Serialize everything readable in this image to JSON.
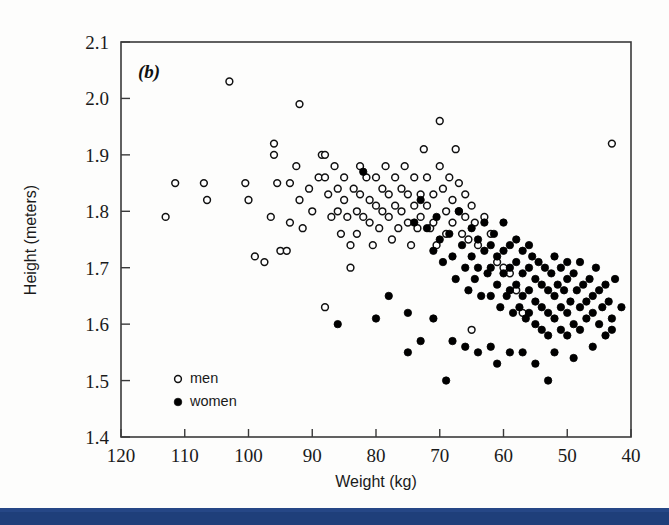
{
  "figure": {
    "panel_label": "(b)",
    "background_color": "#fdfdfc",
    "frame_color": "#3a3a3a",
    "bottom_bar_color": "#1f3f7a"
  },
  "axes": {
    "x_title": "Weight (kg)",
    "y_title": "Height (meters)",
    "x_ticks": [
      "120",
      "110",
      "100",
      "90",
      "80",
      "70",
      "60",
      "50",
      "40"
    ],
    "y_ticks": [
      "2.1",
      "2.0",
      "1.9",
      "1.8",
      "1.7",
      "1.6",
      "1.5",
      "1.4"
    ]
  },
  "legend": {
    "items": [
      {
        "label": "men",
        "marker": "open-circle"
      },
      {
        "label": "women",
        "marker": "filled-circle"
      }
    ]
  },
  "chart_data": {
    "type": "scatter",
    "title": "(b)",
    "xlabel": "Weight (kg)",
    "ylabel": "Height (meters)",
    "xlim": [
      120,
      40
    ],
    "ylim": [
      1.4,
      2.1
    ],
    "x_inverted": true,
    "grid": false,
    "legend_position": "bottom-left-inside",
    "xticks": [
      120,
      110,
      100,
      90,
      80,
      70,
      60,
      50,
      40
    ],
    "yticks": [
      2.1,
      2.0,
      1.9,
      1.8,
      1.7,
      1.6,
      1.5,
      1.4
    ],
    "marker_size_px": 8,
    "series": [
      {
        "name": "men",
        "marker": "open-circle",
        "color": "#111111",
        "fill": "none",
        "points": [
          [
            111.5,
            1.85
          ],
          [
            113.0,
            1.79
          ],
          [
            107.0,
            1.85
          ],
          [
            106.5,
            1.82
          ],
          [
            103.0,
            2.03
          ],
          [
            100.5,
            1.85
          ],
          [
            100.0,
            1.82
          ],
          [
            96.0,
            1.92
          ],
          [
            96.0,
            1.9
          ],
          [
            95.5,
            1.85
          ],
          [
            96.5,
            1.79
          ],
          [
            95.0,
            1.73
          ],
          [
            94.0,
            1.73
          ],
          [
            93.5,
            1.85
          ],
          [
            93.5,
            1.78
          ],
          [
            92.0,
            1.99
          ],
          [
            92.5,
            1.88
          ],
          [
            92.0,
            1.82
          ],
          [
            91.5,
            1.77
          ],
          [
            90.5,
            1.84
          ],
          [
            90.0,
            1.8
          ],
          [
            89.0,
            1.86
          ],
          [
            88.5,
            1.9
          ],
          [
            88.0,
            1.9
          ],
          [
            88.0,
            1.86
          ],
          [
            87.5,
            1.83
          ],
          [
            87.0,
            1.79
          ],
          [
            86.5,
            1.88
          ],
          [
            86.0,
            1.84
          ],
          [
            86.0,
            1.8
          ],
          [
            85.5,
            1.76
          ],
          [
            85.0,
            1.86
          ],
          [
            85.0,
            1.82
          ],
          [
            84.5,
            1.79
          ],
          [
            84.0,
            1.74
          ],
          [
            84.0,
            1.7
          ],
          [
            83.5,
            1.84
          ],
          [
            83.0,
            1.8
          ],
          [
            83.0,
            1.76
          ],
          [
            82.5,
            1.88
          ],
          [
            82.5,
            1.83
          ],
          [
            82.0,
            1.79
          ],
          [
            81.5,
            1.86
          ],
          [
            81.0,
            1.82
          ],
          [
            81.0,
            1.78
          ],
          [
            80.5,
            1.74
          ],
          [
            80.0,
            1.86
          ],
          [
            80.0,
            1.81
          ],
          [
            79.5,
            1.77
          ],
          [
            79.0,
            1.84
          ],
          [
            79.0,
            1.8
          ],
          [
            78.5,
            1.88
          ],
          [
            78.0,
            1.83
          ],
          [
            78.0,
            1.79
          ],
          [
            77.5,
            1.75
          ],
          [
            77.0,
            1.86
          ],
          [
            77.0,
            1.81
          ],
          [
            76.5,
            1.77
          ],
          [
            76.0,
            1.84
          ],
          [
            76.0,
            1.8
          ],
          [
            75.5,
            1.88
          ],
          [
            75.0,
            1.83
          ],
          [
            75.0,
            1.78
          ],
          [
            74.5,
            1.74
          ],
          [
            74.0,
            1.86
          ],
          [
            74.0,
            1.81
          ],
          [
            73.5,
            1.77
          ],
          [
            73.0,
            1.83
          ],
          [
            73.0,
            1.79
          ],
          [
            72.5,
            1.91
          ],
          [
            72.0,
            1.86
          ],
          [
            72.0,
            1.81
          ],
          [
            71.5,
            1.77
          ],
          [
            71.0,
            1.83
          ],
          [
            71.0,
            1.78
          ],
          [
            70.5,
            1.74
          ],
          [
            70.0,
            1.96
          ],
          [
            70.0,
            1.88
          ],
          [
            69.5,
            1.84
          ],
          [
            69.0,
            1.8
          ],
          [
            69.0,
            1.76
          ],
          [
            68.5,
            1.86
          ],
          [
            68.0,
            1.82
          ],
          [
            68.0,
            1.78
          ],
          [
            67.5,
            1.91
          ],
          [
            67.0,
            1.85
          ],
          [
            67.0,
            1.8
          ],
          [
            66.5,
            1.76
          ],
          [
            66.0,
            1.83
          ],
          [
            66.0,
            1.79
          ],
          [
            65.5,
            1.75
          ],
          [
            65.0,
            1.81
          ],
          [
            65.0,
            1.59
          ],
          [
            64.5,
            1.78
          ],
          [
            64.0,
            1.74
          ],
          [
            63.0,
            1.79
          ],
          [
            62.0,
            1.76
          ],
          [
            61.0,
            1.71
          ],
          [
            60.0,
            1.7
          ],
          [
            59.0,
            1.69
          ],
          [
            58.0,
            1.66
          ],
          [
            57.0,
            1.62
          ],
          [
            43.0,
            1.92
          ],
          [
            88.0,
            1.63
          ],
          [
            99.0,
            1.72
          ],
          [
            97.5,
            1.71
          ]
        ]
      },
      {
        "name": "women",
        "marker": "filled-circle",
        "color": "#000000",
        "fill": "#000000",
        "points": [
          [
            82.0,
            1.87
          ],
          [
            74.0,
            1.78
          ],
          [
            73.0,
            1.82
          ],
          [
            72.0,
            1.77
          ],
          [
            71.0,
            1.73
          ],
          [
            70.5,
            1.79
          ],
          [
            70.0,
            1.75
          ],
          [
            69.5,
            1.71
          ],
          [
            69.0,
            1.5
          ],
          [
            68.5,
            1.76
          ],
          [
            68.0,
            1.72
          ],
          [
            67.5,
            1.68
          ],
          [
            67.0,
            1.8
          ],
          [
            66.5,
            1.74
          ],
          [
            66.0,
            1.7
          ],
          [
            65.5,
            1.66
          ],
          [
            65.0,
            1.77
          ],
          [
            65.0,
            1.72
          ],
          [
            64.5,
            1.68
          ],
          [
            64.0,
            1.75
          ],
          [
            64.0,
            1.7
          ],
          [
            63.5,
            1.65
          ],
          [
            63.0,
            1.78
          ],
          [
            63.0,
            1.73
          ],
          [
            62.5,
            1.69
          ],
          [
            62.0,
            1.74
          ],
          [
            62.0,
            1.7
          ],
          [
            62.0,
            1.65
          ],
          [
            61.5,
            1.76
          ],
          [
            61.0,
            1.72
          ],
          [
            61.0,
            1.67
          ],
          [
            60.5,
            1.63
          ],
          [
            60.0,
            1.78
          ],
          [
            60.0,
            1.73
          ],
          [
            60.0,
            1.69
          ],
          [
            59.5,
            1.65
          ],
          [
            59.0,
            1.74
          ],
          [
            59.0,
            1.7
          ],
          [
            59.0,
            1.66
          ],
          [
            58.5,
            1.62
          ],
          [
            58.0,
            1.75
          ],
          [
            58.0,
            1.71
          ],
          [
            58.0,
            1.67
          ],
          [
            57.5,
            1.63
          ],
          [
            57.0,
            1.73
          ],
          [
            57.0,
            1.69
          ],
          [
            57.0,
            1.65
          ],
          [
            56.5,
            1.61
          ],
          [
            56.0,
            1.74
          ],
          [
            56.0,
            1.7
          ],
          [
            56.0,
            1.66
          ],
          [
            56.0,
            1.62
          ],
          [
            55.5,
            1.72
          ],
          [
            55.0,
            1.68
          ],
          [
            55.0,
            1.64
          ],
          [
            55.0,
            1.6
          ],
          [
            54.5,
            1.71
          ],
          [
            54.0,
            1.67
          ],
          [
            54.0,
            1.63
          ],
          [
            54.0,
            1.59
          ],
          [
            53.5,
            1.7
          ],
          [
            53.0,
            1.66
          ],
          [
            53.0,
            1.62
          ],
          [
            53.0,
            1.58
          ],
          [
            52.5,
            1.69
          ],
          [
            52.0,
            1.72
          ],
          [
            52.0,
            1.65
          ],
          [
            52.0,
            1.61
          ],
          [
            51.5,
            1.67
          ],
          [
            51.0,
            1.7
          ],
          [
            51.0,
            1.63
          ],
          [
            51.0,
            1.59
          ],
          [
            50.5,
            1.66
          ],
          [
            50.0,
            1.71
          ],
          [
            50.0,
            1.68
          ],
          [
            50.0,
            1.62
          ],
          [
            50.0,
            1.58
          ],
          [
            49.5,
            1.64
          ],
          [
            49.0,
            1.69
          ],
          [
            49.0,
            1.6
          ],
          [
            48.5,
            1.66
          ],
          [
            48.0,
            1.71
          ],
          [
            48.0,
            1.63
          ],
          [
            48.0,
            1.59
          ],
          [
            47.5,
            1.67
          ],
          [
            47.0,
            1.64
          ],
          [
            47.0,
            1.61
          ],
          [
            46.5,
            1.68
          ],
          [
            46.0,
            1.65
          ],
          [
            46.0,
            1.62
          ],
          [
            45.5,
            1.7
          ],
          [
            45.0,
            1.66
          ],
          [
            45.0,
            1.6
          ],
          [
            44.5,
            1.63
          ],
          [
            44.0,
            1.67
          ],
          [
            44.0,
            1.58
          ],
          [
            43.5,
            1.64
          ],
          [
            43.0,
            1.61
          ],
          [
            42.5,
            1.68
          ],
          [
            53.0,
            1.5
          ],
          [
            59.0,
            1.55
          ],
          [
            62.0,
            1.56
          ],
          [
            66.0,
            1.56
          ],
          [
            71.0,
            1.61
          ],
          [
            75.0,
            1.62
          ],
          [
            78.0,
            1.65
          ],
          [
            80.0,
            1.61
          ],
          [
            86.0,
            1.6
          ],
          [
            75.0,
            1.55
          ],
          [
            73.0,
            1.57
          ],
          [
            68.0,
            1.57
          ],
          [
            64.0,
            1.55
          ],
          [
            61.0,
            1.53
          ],
          [
            57.0,
            1.55
          ],
          [
            55.0,
            1.53
          ],
          [
            52.0,
            1.55
          ],
          [
            49.0,
            1.54
          ],
          [
            46.0,
            1.56
          ],
          [
            43.0,
            1.59
          ],
          [
            41.5,
            1.63
          ]
        ]
      }
    ]
  }
}
